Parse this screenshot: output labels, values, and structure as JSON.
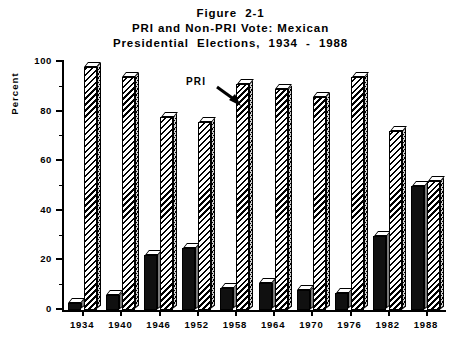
{
  "figure": {
    "title_lines": [
      "Figure  2-1",
      "PRI and Non-PRI Vote: Mexican",
      "Presidential  Elections,  1934  -  1988"
    ],
    "annotation": {
      "label": "PRI",
      "target": "hatched PRI bar for 1958"
    }
  },
  "axes": {
    "y_title": "Percent",
    "y_ticks": [
      "0",
      "20",
      "40",
      "60",
      "80",
      "100"
    ],
    "y_minor_ticks": [
      10,
      30,
      50,
      70,
      90
    ]
  },
  "chart_data": {
    "type": "bar",
    "xlabel": "",
    "ylabel": "Percent",
    "ylim": [
      0,
      100
    ],
    "ytick_step": 20,
    "grid": false,
    "legend": "none",
    "categories": [
      "1934",
      "1940",
      "1946",
      "1952",
      "1958",
      "1964",
      "1970",
      "1976",
      "1982",
      "1988"
    ],
    "series": [
      {
        "name": "Non-PRI",
        "style": "solid-black",
        "values": [
          3,
          6,
          22,
          25,
          9,
          11,
          8,
          7,
          30,
          50
        ]
      },
      {
        "name": "PRI",
        "style": "hatched",
        "values": [
          98,
          94,
          78,
          76,
          91,
          89,
          86,
          94,
          72,
          52
        ]
      }
    ]
  }
}
